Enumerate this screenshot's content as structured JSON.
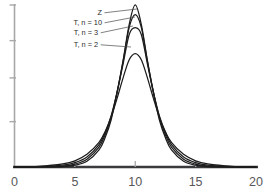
{
  "chart_data": {
    "type": "line",
    "title": "",
    "subtitle": "",
    "xlabel": "",
    "ylabel": "",
    "xlim": [
      0,
      20
    ],
    "ylim": [
      0,
      1.05
    ],
    "xticks": [
      0,
      5,
      10,
      15,
      20
    ],
    "xtick_labels": [
      "0",
      "5",
      "10",
      "15",
      "20"
    ],
    "yticks": [
      0,
      0.28,
      0.55,
      0.78,
      1.0
    ],
    "ytick_labels": [
      "",
      "",
      "",
      "",
      ""
    ],
    "grid": false,
    "legend": "inline-annotations",
    "center": 10,
    "series": [
      {
        "name": "Z",
        "label": "Z",
        "peak_value": 1.0,
        "scale": 1.0,
        "df": null,
        "color": "#1c1c1c",
        "x": [
          0,
          2,
          4,
          5,
          6,
          7,
          7.5,
          8,
          8.5,
          9,
          9.5,
          10,
          10.5,
          11,
          11.5,
          12,
          12.5,
          13,
          14,
          15,
          16,
          18,
          20
        ],
        "y": [
          0.0,
          0.0,
          0.003,
          0.011,
          0.035,
          0.105,
          0.18,
          0.29,
          0.46,
          0.66,
          0.88,
          1.0,
          0.88,
          0.66,
          0.46,
          0.29,
          0.18,
          0.105,
          0.035,
          0.011,
          0.003,
          0.0,
          0.0
        ]
      },
      {
        "name": "T, n = 10",
        "label": "T, n = 10",
        "peak_value": 0.94,
        "scale": 1.06,
        "df": 10,
        "color": "#1c1c1c",
        "x": [
          0,
          2,
          4,
          5,
          6,
          7,
          7.5,
          8,
          8.5,
          9,
          9.5,
          10,
          10.5,
          11,
          11.5,
          12,
          12.5,
          13,
          14,
          15,
          16,
          18,
          20
        ],
        "y": [
          0.0,
          0.0,
          0.006,
          0.018,
          0.048,
          0.122,
          0.198,
          0.305,
          0.465,
          0.655,
          0.862,
          0.94,
          0.862,
          0.655,
          0.465,
          0.305,
          0.198,
          0.122,
          0.048,
          0.018,
          0.006,
          0.0,
          0.0
        ]
      },
      {
        "name": "T, n = 3",
        "label": "T, n = 3",
        "peak_value": 0.86,
        "scale": 1.14,
        "df": 3,
        "color": "#1c1c1c",
        "x": [
          0,
          2,
          4,
          5,
          6,
          7,
          7.5,
          8,
          8.5,
          9,
          9.5,
          10,
          10.5,
          11,
          11.5,
          12,
          12.5,
          13,
          14,
          15,
          16,
          18,
          20
        ],
        "y": [
          0.0,
          0.002,
          0.012,
          0.027,
          0.062,
          0.138,
          0.212,
          0.315,
          0.462,
          0.638,
          0.818,
          0.86,
          0.818,
          0.638,
          0.462,
          0.315,
          0.212,
          0.138,
          0.062,
          0.027,
          0.012,
          0.002,
          0.0
        ]
      },
      {
        "name": "T, n = 2",
        "label": "T, n = 2",
        "peak_value": 0.7,
        "scale": 1.28,
        "df": 2,
        "color": "#1c1c1c",
        "x": [
          0,
          2,
          4,
          5,
          6,
          7,
          7.5,
          8,
          8.5,
          9,
          9.5,
          10,
          10.5,
          11,
          11.5,
          12,
          12.5,
          13,
          14,
          15,
          16,
          18,
          20
        ],
        "y": [
          0.0,
          0.004,
          0.019,
          0.038,
          0.078,
          0.152,
          0.218,
          0.308,
          0.425,
          0.552,
          0.662,
          0.7,
          0.662,
          0.552,
          0.425,
          0.308,
          0.218,
          0.152,
          0.078,
          0.038,
          0.019,
          0.004,
          0.0
        ]
      }
    ],
    "annotations": [
      {
        "text": "Z",
        "label_x": 98,
        "label_y": 15,
        "leader_to_x": 137,
        "leader_to_y": 9
      },
      {
        "text": "T, n = 10",
        "label_x": 67,
        "label_y": 25,
        "leader_to_x": 135,
        "leader_to_y": 17
      },
      {
        "text": "T, n = 3",
        "label_x": 67,
        "label_y": 35,
        "leader_to_x": 133,
        "leader_to_y": 26
      },
      {
        "text": "T, n = 2",
        "label_x": 67,
        "label_y": 47,
        "leader_to_x": 131,
        "leader_to_y": 47
      }
    ]
  },
  "axes": {
    "x_axis_color": "#3a3a3c",
    "y_axis_color": "#a8a8aa",
    "tick_color": "#a8a8aa",
    "curve_color": "#1c1c1c"
  },
  "caption": {
    "fragment": ""
  }
}
